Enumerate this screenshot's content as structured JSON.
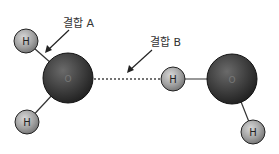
{
  "diagram": {
    "title": "",
    "labels": {
      "bond_a": "결합 A",
      "bond_b": "결합 B"
    },
    "atoms": [
      {
        "id": "h1",
        "symbol": "H",
        "cx": 26,
        "cy": 41,
        "r": 12
      },
      {
        "id": "o1",
        "symbol": "O",
        "cx": 68,
        "cy": 78,
        "r": 25
      },
      {
        "id": "h2",
        "symbol": "H",
        "cx": 27,
        "cy": 122,
        "r": 12
      },
      {
        "id": "h3",
        "symbol": "H",
        "cx": 173,
        "cy": 79,
        "r": 12
      },
      {
        "id": "o2",
        "symbol": "O",
        "cx": 232,
        "cy": 79,
        "r": 25
      },
      {
        "id": "h4",
        "symbol": "H",
        "cx": 253,
        "cy": 132,
        "r": 12
      }
    ],
    "bonds": [
      {
        "from": "h1",
        "to": "o1",
        "type": "covalent",
        "label": "결합 A"
      },
      {
        "from": "h2",
        "to": "o1",
        "type": "covalent"
      },
      {
        "from": "o1",
        "to": "h3",
        "type": "hydrogen",
        "style": "dotted",
        "label": "결합 B"
      },
      {
        "from": "h3",
        "to": "o2",
        "type": "covalent"
      },
      {
        "from": "o2",
        "to": "h4",
        "type": "covalent"
      }
    ],
    "colors": {
      "oxygen": "#3a3a3a",
      "hydrogen": "#9a9a9a",
      "bond": "#333333",
      "text": "#333333"
    }
  }
}
